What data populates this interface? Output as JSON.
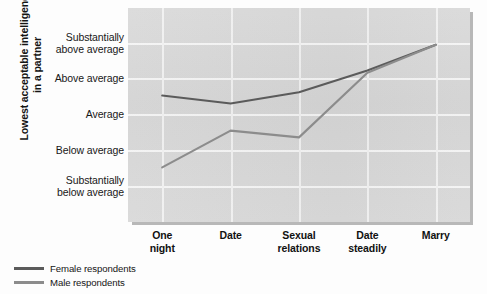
{
  "chart_data": {
    "type": "line",
    "title": "",
    "subtitle": "",
    "xlabel": "",
    "ylabel": "Lowest acceptable intelligence in a partner",
    "categories": [
      "One night",
      "Date",
      "Sexual relations",
      "Date steadily",
      "Marry"
    ],
    "ytick_labels": [
      "Substantially above average",
      "Above average",
      "Average",
      "Below average",
      "Substantially below average"
    ],
    "ytick_values": [
      5,
      4,
      3,
      2,
      1
    ],
    "ylim": [
      0.5,
      5.5
    ],
    "grid": true,
    "legend_position": "below-left",
    "series": [
      {
        "name": "Female respondents",
        "color": "#5b5b5b",
        "values": [
          3.53,
          3.31,
          3.62,
          4.23,
          4.95
        ]
      },
      {
        "name": "Male respondents",
        "color": "#8c8c8c",
        "values": [
          1.52,
          2.55,
          2.36,
          4.17,
          4.95
        ]
      }
    ]
  },
  "axis": {
    "y_title_line1": "Lowest acceptable intelligence",
    "y_title_line2": "in a partner"
  },
  "colors": {
    "plot_background": "#d6d6d6",
    "gridline": "#f4f4f4",
    "female_line": "#5b5b5b",
    "male_line": "#8c8c8c",
    "text": "#141414"
  }
}
